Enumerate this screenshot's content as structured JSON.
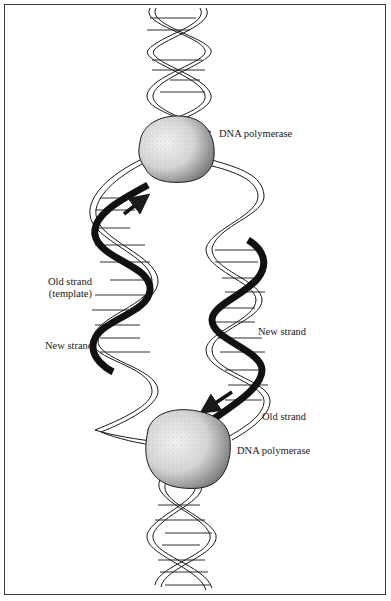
{
  "figure": {
    "type": "DNA replication diagram",
    "labels": {
      "polymerase_top": "DNA polymerase",
      "old_strand_template_line1": "Old strand",
      "old_strand_template_line2": "(template)",
      "new_strand_left": "New strand",
      "new_strand_right": "New strand",
      "old_strand_right": "Old strand",
      "polymerase_bottom": "DNA polymerase"
    },
    "colors": {
      "ink": "#1a1a1a",
      "frame": "#3a3a3a",
      "blob_fill": "#d9d9d9",
      "background": "#ffffff"
    }
  }
}
